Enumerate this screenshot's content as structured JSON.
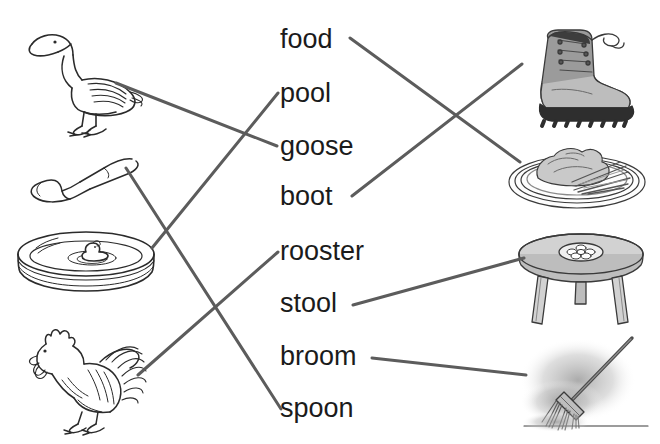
{
  "worksheet": {
    "type": "matching-activity",
    "description": "Picture-to-word matching worksheet with oo words",
    "line_color": "#5c5c5c",
    "text_color": "#1b1b1b",
    "background": "#ffffff"
  },
  "words": [
    {
      "id": "food",
      "label": "food",
      "x": 280,
      "y": 26
    },
    {
      "id": "pool",
      "label": "pool",
      "x": 280,
      "y": 80
    },
    {
      "id": "goose",
      "label": "goose",
      "x": 280,
      "y": 133
    },
    {
      "id": "boot",
      "label": "boot",
      "x": 280,
      "y": 183
    },
    {
      "id": "rooster",
      "label": "rooster",
      "x": 280,
      "y": 238
    },
    {
      "id": "stool",
      "label": "stool",
      "x": 280,
      "y": 290
    },
    {
      "id": "broom",
      "label": "broom",
      "x": 280,
      "y": 343
    },
    {
      "id": "spoon",
      "label": "spoon",
      "x": 280,
      "y": 395
    }
  ],
  "left_pictures": [
    {
      "id": "goose-picture",
      "alt": "goose"
    },
    {
      "id": "spoon-picture",
      "alt": "spoon"
    },
    {
      "id": "pool-picture",
      "alt": "pool"
    },
    {
      "id": "rooster-picture",
      "alt": "rooster"
    }
  ],
  "right_pictures": [
    {
      "id": "boot-picture",
      "alt": "boot"
    },
    {
      "id": "food-picture",
      "alt": "food"
    },
    {
      "id": "stool-picture",
      "alt": "stool"
    },
    {
      "id": "broom-picture",
      "alt": "broom"
    }
  ],
  "connections": [
    {
      "id": "goose-line",
      "from": "goose-picture",
      "to": "goose",
      "x1": 116,
      "y1": 83,
      "x2": 277,
      "y2": 146
    },
    {
      "id": "pool-line",
      "from": "pool-picture",
      "to": "pool",
      "x1": 152,
      "y1": 248,
      "x2": 278,
      "y2": 93
    },
    {
      "id": "spoon-line",
      "from": "spoon-picture",
      "to": "spoon",
      "x1": 126,
      "y1": 168,
      "x2": 281,
      "y2": 409
    },
    {
      "id": "rooster-line",
      "from": "rooster-picture",
      "to": "rooster",
      "x1": 138,
      "y1": 375,
      "x2": 278,
      "y2": 252
    },
    {
      "id": "food-line",
      "from": "food",
      "to": "food-picture",
      "x1": 350,
      "y1": 38,
      "x2": 520,
      "y2": 162
    },
    {
      "id": "boot-line",
      "from": "boot",
      "to": "boot-picture",
      "x1": 352,
      "y1": 196,
      "x2": 522,
      "y2": 64
    },
    {
      "id": "stool-line",
      "from": "stool",
      "to": "stool-picture",
      "x1": 353,
      "y1": 305,
      "x2": 524,
      "y2": 258
    },
    {
      "id": "broom-line",
      "from": "broom",
      "to": "broom-picture",
      "x1": 372,
      "y1": 358,
      "x2": 526,
      "y2": 375
    }
  ]
}
